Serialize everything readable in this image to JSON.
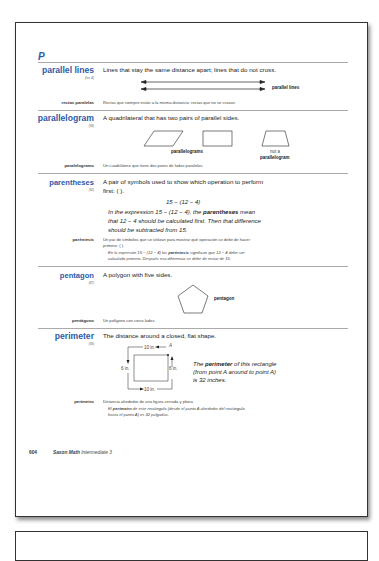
{
  "section_letter": "P",
  "entries": [
    {
      "term": "parallel lines",
      "ref": "(Inv. 4)",
      "definition": "Lines that stay the same distance apart; lines that do not cross.",
      "figure_label": "parallel lines",
      "spanish_term": "rectas paralelas",
      "spanish_definition": "Rectas que siempre están a la misma distancia; rectas que no se cruzan."
    },
    {
      "term": "parallelogram",
      "ref": "(93)",
      "definition": "A quadrilateral that has two pairs of parallel sides.",
      "figure_label_1": "parallelograms",
      "figure_label_2a": "not a",
      "figure_label_2b": "parallelogram",
      "spanish_term": "paralelogramo",
      "spanish_definition": "Un cuadrilátero que tiene dos pares de lados paralelos."
    },
    {
      "term": "parentheses",
      "ref": "(92)",
      "definition_line1": "A pair of symbols used to show which operation to perform",
      "definition_line2": "first: ( ).",
      "expression": "15 − (12 − 4)",
      "example_pre": "In the expression 15 − (12 − 4), the ",
      "example_bold": "parentheses",
      "example_post1": " mean",
      "example_line2": "that 12 − 4 should be calculated first. Then that difference",
      "example_line3": "should be subtracted from 15.",
      "spanish_term": "paréntesis",
      "spanish_definition_line1": "Un par de símbolos que se utilizan para mostrar qué operación se debe de hacer",
      "spanish_definition_line2": "primero: ( ).",
      "spanish_example_pre": "En la expresión 15 − (12 − 4) los ",
      "spanish_example_bold": "paréntesis",
      "spanish_example_post": " significan que 12 − 4 debe ser",
      "spanish_example_line2": "calculado primero. Después esa diferencia se debe de restar de 15."
    },
    {
      "term": "pentagon",
      "ref": "(67)",
      "definition": "A polygon with five sides.",
      "figure_label": "pentagon",
      "spanish_term": "pentágono",
      "spanish_definition": "Un polígono con cinco lados."
    },
    {
      "term": "perimeter",
      "ref": "(58)",
      "definition": "The distance around a closed, flat shape.",
      "figure": {
        "top": "10 in.",
        "bottom": "10 in.",
        "left": "6 in.",
        "right": "6 in.",
        "point": "A"
      },
      "example_pre": "The ",
      "example_bold": "perimeter",
      "example_post": " of this rectangle",
      "example_line2": "(from point A around to point A)",
      "example_line3": "is 32 inches.",
      "spanish_term": "perímetro",
      "spanish_definition": "Distancia alrededor de una figura cerrada y plana.",
      "spanish_example_pre": "El ",
      "spanish_example_bold": "perímetro",
      "spanish_example_post": " de este rectángulo (desde el punto A alrededor del rectángulo",
      "spanish_example_line2": "hasta el punto A) es 32 pulgadas."
    }
  ],
  "footer": {
    "page_number": "604",
    "book_title_bold": "Saxon Math",
    "book_title_italic": "Intermediate 3"
  }
}
